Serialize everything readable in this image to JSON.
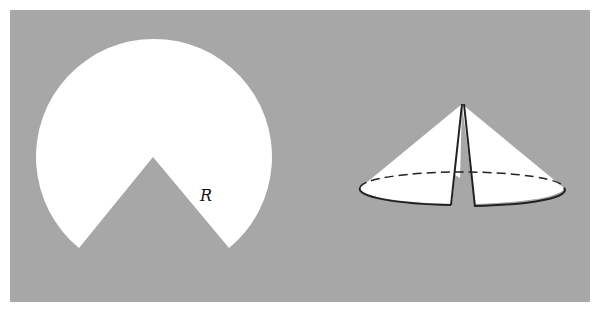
{
  "figure": {
    "left_label": "R",
    "colors": {
      "background": "#a7a7a7",
      "shape": "#ffffff",
      "line": "#222222"
    }
  }
}
